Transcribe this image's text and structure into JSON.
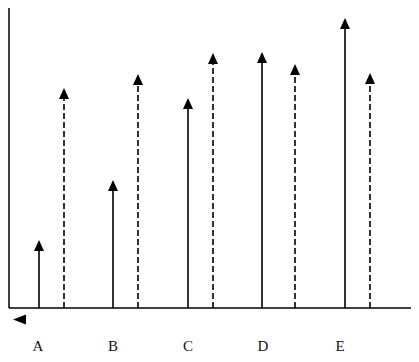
{
  "title": "",
  "chart_data": {
    "type": "arrow-diagram",
    "title": "",
    "xlabel": "",
    "ylabel": "",
    "categories": [
      "A",
      "B",
      "C",
      "D",
      "E"
    ],
    "series": [
      {
        "name": "solid",
        "style": "solid",
        "values": [
          68,
          128,
          210,
          256,
          290
        ]
      },
      {
        "name": "dashed",
        "style": "dashed",
        "values": [
          220,
          234,
          255,
          244,
          235
        ]
      }
    ],
    "ylim": [
      0,
      300
    ],
    "grid": false,
    "legend": "none",
    "annotations": [
      "left-pointing arrowhead below origin"
    ]
  },
  "colors": {
    "line": "#000000",
    "background": "#ffffff"
  },
  "layout": {
    "origin_x": 9,
    "baseline_y": 308,
    "axis_top_y": 8,
    "axis_right_x": 411,
    "solid_x": [
      39,
      113,
      188,
      262,
      345
    ],
    "dashed_x": [
      64,
      138,
      213,
      295,
      370
    ],
    "label_x": [
      38,
      113,
      188,
      263,
      340
    ]
  }
}
